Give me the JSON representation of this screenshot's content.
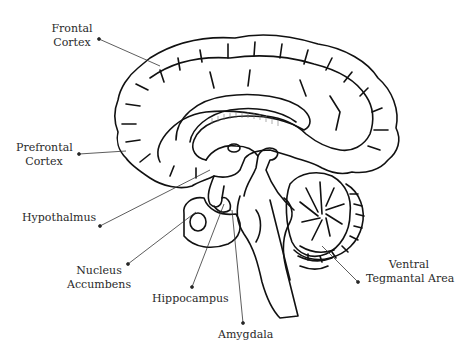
{
  "diagram": {
    "colors": {
      "background": "#ffffff",
      "line": "#111111",
      "text": "#2a2a2a",
      "leader": "#333333"
    },
    "labels": {
      "frontal_cortex": {
        "line1": "Frontal",
        "line2": "Cortex"
      },
      "prefrontal_cortex": {
        "line1": "Prefrontal",
        "line2": "Cortex"
      },
      "hypothalamus": {
        "line1": "Hypothalmus"
      },
      "nucleus_accumbens": {
        "line1": "Nucleus",
        "line2": "Accumbens"
      },
      "hippocampus": {
        "line1": "Hippocampus"
      },
      "amygdala": {
        "line1": "Amygdala"
      },
      "ventral_tegmental_area": {
        "line1": "Ventral",
        "line2": "Tegmantal Area"
      }
    }
  }
}
